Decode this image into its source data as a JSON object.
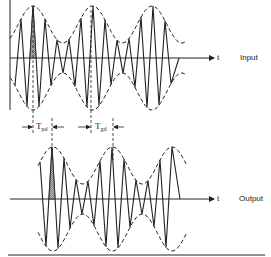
{
  "diagram": {
    "panels": [
      {
        "name": "input",
        "label": "Input",
        "axis_label": "t"
      },
      {
        "name": "output",
        "label": "Output",
        "axis_label": "t"
      }
    ],
    "delays": {
      "phase_delay": {
        "symbol": "T",
        "subscript": "pd"
      },
      "group_delay": {
        "symbol": "T",
        "subscript": "gd"
      }
    },
    "colors": {
      "line": "#222222",
      "hatch": "#888888",
      "background": "#ffffff"
    }
  }
}
